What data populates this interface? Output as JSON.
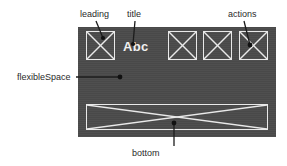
{
  "diagram": {
    "kind": "appbar-anatomy",
    "background_color": "#ffffff",
    "panel_color": "#4b4b4b",
    "wireframe_stroke_color": "#e9e9e9",
    "label_color": "#2a2a2a",
    "leader_color": "#1c1c1c",
    "title_color": "#f0f0f0"
  },
  "appbar": {
    "title_text": "Abc",
    "leading": {
      "name": "leading"
    },
    "actions": [
      {
        "name": "action-1"
      },
      {
        "name": "action-2"
      },
      {
        "name": "action-3"
      }
    ],
    "bottom": {
      "name": "bottom"
    }
  },
  "annotations": {
    "leading": "leading",
    "title": "title",
    "actions": "actions",
    "flexible_space": "flexibleSpace",
    "bottom": "bottom"
  }
}
